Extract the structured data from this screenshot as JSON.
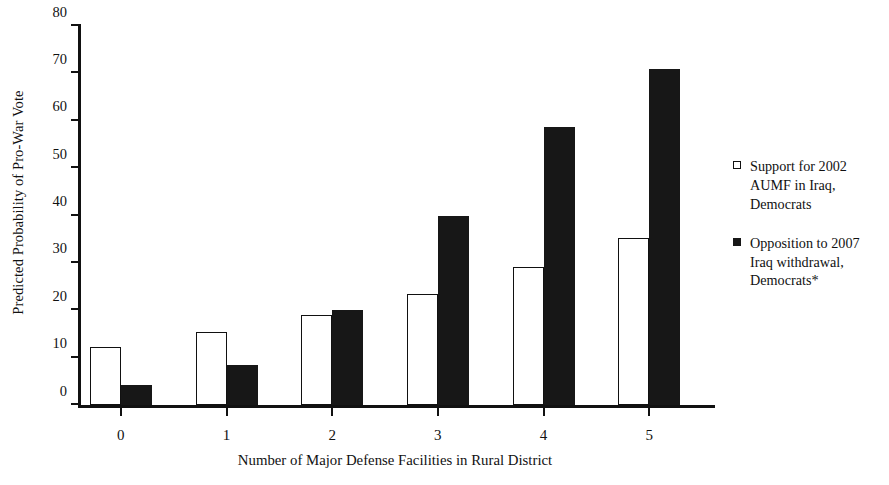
{
  "chart_data": {
    "type": "bar",
    "title": "",
    "xlabel": "Number of Major Defense Facilities in Rural District",
    "ylabel": "Predicted Probability of Pro-War Vote",
    "categories": [
      "0",
      "1",
      "2",
      "3",
      "4",
      "5"
    ],
    "series": [
      {
        "name": "Support for 2002 AUMF in Iraq, Democrats",
        "style": "open",
        "values": [
          12.2,
          15.5,
          18.9,
          23.4,
          29.2,
          35.2
        ]
      },
      {
        "name": "Opposition to 2007 Iraq withdrawal, Democrats*",
        "style": "filled",
        "values": [
          4.3,
          8.4,
          20.0,
          39.8,
          58.6,
          71.0
        ]
      }
    ],
    "ylim": [
      0,
      80
    ],
    "yticks": [
      0,
      10,
      20,
      30,
      40,
      50,
      60,
      70,
      80
    ],
    "yticklabels": [
      "0",
      "10",
      "20",
      "30",
      "40",
      "50",
      "60",
      "70",
      "80"
    ],
    "grid": false,
    "legend_position": "right"
  },
  "legend": {
    "entries": [
      {
        "label": "Support for 2002 AUMF in Iraq, Democrats",
        "swatch": "open"
      },
      {
        "label": "Opposition to 2007 Iraq withdrawal, Democrats*",
        "swatch": "filled"
      }
    ]
  },
  "colors": {
    "series_open_fill": "#ffffff",
    "series_open_stroke": "#111111",
    "series_filled_fill": "#171717",
    "axis": "#111111",
    "background": "#ffffff"
  }
}
